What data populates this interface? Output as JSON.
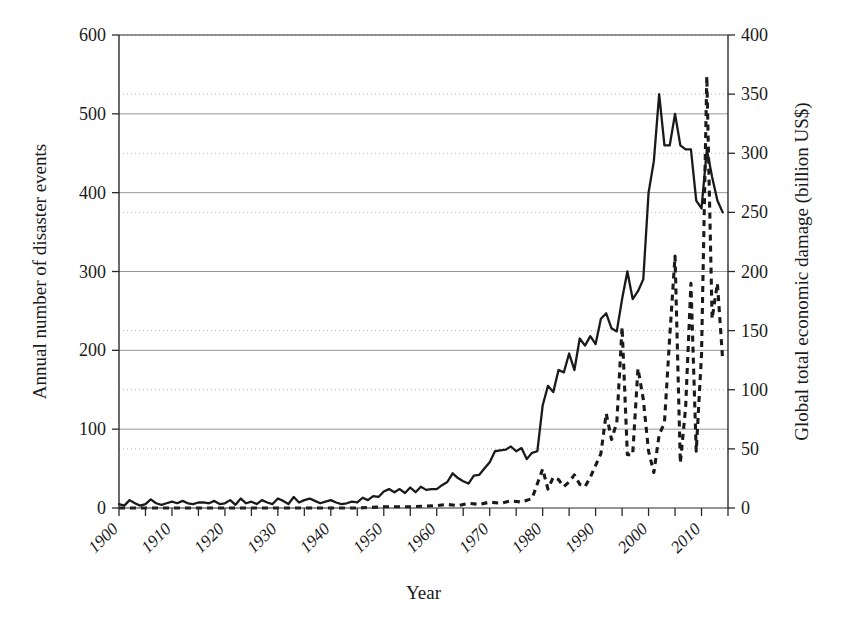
{
  "chart_data": {
    "type": "line",
    "title": "",
    "xlabel": "Year",
    "ylabel": "Annual number of disaster events",
    "ylabel_right": "Global total economic damage (billion US$)",
    "xlim": [
      1900,
      2015
    ],
    "ylim": [
      0,
      600
    ],
    "ylim_right": [
      0,
      400
    ],
    "xticks": [
      1900,
      1905,
      1910,
      1915,
      1920,
      1925,
      1930,
      1935,
      1940,
      1945,
      1950,
      1955,
      1960,
      1965,
      1970,
      1975,
      1980,
      1985,
      1990,
      1995,
      2000,
      2005,
      2010,
      2015
    ],
    "xtick_labels": [
      "1900",
      "1910",
      "1920",
      "1930",
      "1940",
      "1950",
      "1960",
      "1970",
      "1980",
      "1990",
      "2000",
      "2010"
    ],
    "xtick_label_values": [
      1900,
      1910,
      1920,
      1930,
      1940,
      1950,
      1960,
      1970,
      1980,
      1990,
      2000,
      2010
    ],
    "yticks_left": [
      0,
      100,
      200,
      300,
      400,
      500,
      600
    ],
    "yticks_right": [
      0,
      50,
      100,
      150,
      200,
      250,
      300,
      350,
      400
    ],
    "grid": true,
    "grid_left_color": "#8a8a8a",
    "grid_right_color": "#b5b5b5",
    "legend": "none",
    "series": [
      {
        "name": "Annual number of disaster events",
        "axis": "left",
        "style": "solid",
        "color": "#1a1a1a",
        "x": [
          1900,
          1901,
          1902,
          1903,
          1904,
          1905,
          1906,
          1907,
          1908,
          1909,
          1910,
          1911,
          1912,
          1913,
          1914,
          1915,
          1916,
          1917,
          1918,
          1919,
          1920,
          1921,
          1922,
          1923,
          1924,
          1925,
          1926,
          1927,
          1928,
          1929,
          1930,
          1931,
          1932,
          1933,
          1934,
          1935,
          1936,
          1937,
          1938,
          1939,
          1940,
          1941,
          1942,
          1943,
          1944,
          1945,
          1946,
          1947,
          1948,
          1949,
          1950,
          1951,
          1952,
          1953,
          1954,
          1955,
          1956,
          1957,
          1958,
          1959,
          1960,
          1961,
          1962,
          1963,
          1964,
          1965,
          1966,
          1967,
          1968,
          1969,
          1970,
          1971,
          1972,
          1973,
          1974,
          1975,
          1976,
          1977,
          1978,
          1979,
          1980,
          1981,
          1982,
          1983,
          1984,
          1985,
          1986,
          1987,
          1988,
          1989,
          1990,
          1991,
          1992,
          1993,
          1994,
          1995,
          1996,
          1997,
          1998,
          1999,
          2000,
          2001,
          2002,
          2003,
          2004,
          2005,
          2006,
          2007,
          2008,
          2009,
          2010,
          2011,
          2012,
          2013,
          2014
        ],
        "values": [
          5,
          3,
          10,
          6,
          3,
          5,
          11,
          6,
          4,
          6,
          8,
          6,
          9,
          6,
          5,
          7,
          7,
          6,
          9,
          5,
          6,
          10,
          4,
          12,
          6,
          8,
          5,
          10,
          7,
          5,
          12,
          9,
          5,
          14,
          7,
          10,
          12,
          9,
          6,
          8,
          10,
          7,
          5,
          6,
          8,
          7,
          13,
          10,
          15,
          14,
          21,
          24,
          20,
          24,
          19,
          26,
          20,
          27,
          23,
          24,
          24,
          29,
          33,
          44,
          38,
          34,
          31,
          41,
          42,
          50,
          58,
          72,
          73,
          74,
          78,
          72,
          76,
          62,
          70,
          72,
          130,
          155,
          147,
          175,
          172,
          196,
          175,
          215,
          206,
          218,
          208,
          240,
          247,
          228,
          224,
          265,
          300,
          265,
          275,
          290,
          400,
          440,
          525,
          460,
          460,
          500,
          460,
          455,
          455,
          390,
          380,
          455,
          420,
          390,
          375
        ]
      },
      {
        "name": "Global total economic damage (billion US$)",
        "axis": "right",
        "style": "dashed",
        "color": "#1a1a1a",
        "x": [
          1900,
          1905,
          1910,
          1915,
          1920,
          1925,
          1930,
          1935,
          1940,
          1945,
          1950,
          1955,
          1960,
          1962,
          1964,
          1966,
          1968,
          1970,
          1972,
          1974,
          1976,
          1978,
          1980,
          1981,
          1982,
          1983,
          1984,
          1985,
          1986,
          1987,
          1988,
          1989,
          1990,
          1991,
          1992,
          1993,
          1994,
          1995,
          1996,
          1997,
          1998,
          1999,
          2000,
          2001,
          2002,
          2003,
          2004,
          2005,
          2006,
          2007,
          2008,
          2009,
          2010,
          2011,
          2012,
          2013,
          2014
        ],
        "values": [
          0,
          0,
          0,
          0,
          0,
          0,
          0,
          0,
          0,
          0,
          1,
          1,
          2,
          3,
          2,
          4,
          3,
          5,
          4,
          6,
          5,
          8,
          33,
          16,
          26,
          24,
          18,
          22,
          28,
          20,
          18,
          26,
          36,
          46,
          80,
          58,
          72,
          153,
          45,
          45,
          118,
          92,
          48,
          30,
          62,
          72,
          145,
          213,
          38,
          85,
          190,
          48,
          130,
          365,
          160,
          190,
          125
        ]
      }
    ]
  },
  "axes": {
    "left_title": "Annual number of disaster events",
    "right_title": "Global total economic damage (billion US$)",
    "bottom_title": "Year"
  }
}
